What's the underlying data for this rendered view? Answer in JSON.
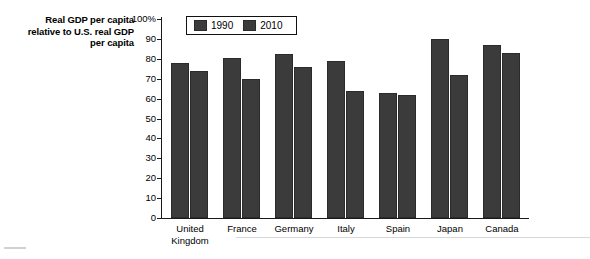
{
  "chart_data": {
    "type": "bar",
    "title": "Real GDP per capita relative to U.S. real GDP per capita",
    "title_lines": [
      "Real GDP per capita",
      "relative to U.S. real GDP",
      "per capita"
    ],
    "xlabel": "",
    "ylabel": "",
    "ylim": [
      0,
      100
    ],
    "yticks": [
      {
        "value": 100,
        "label": "100%"
      },
      {
        "value": 90,
        "label": "90"
      },
      {
        "value": 80,
        "label": "80"
      },
      {
        "value": 70,
        "label": "70"
      },
      {
        "value": 60,
        "label": "60"
      },
      {
        "value": 50,
        "label": "50"
      },
      {
        "value": 40,
        "label": "40"
      },
      {
        "value": 30,
        "label": "30"
      },
      {
        "value": 20,
        "label": "20"
      },
      {
        "value": 10,
        "label": "10"
      },
      {
        "value": 0,
        "label": "0"
      }
    ],
    "grid": false,
    "legend_position": "top-left-inside",
    "categories": [
      "United Kingdom",
      "France",
      "Germany",
      "Italy",
      "Spain",
      "Japan",
      "Canada"
    ],
    "category_lines": [
      [
        "United",
        "Kingdom"
      ],
      [
        "France"
      ],
      [
        "Germany"
      ],
      [
        "Italy"
      ],
      [
        "Spain"
      ],
      [
        "Japan"
      ],
      [
        "Canada"
      ]
    ],
    "series": [
      {
        "name": "1990",
        "color": "#3b3b3b",
        "values": [
          78,
          80.5,
          82.5,
          79,
          63,
          90,
          87
        ]
      },
      {
        "name": "2010",
        "color": "#3b3b3b",
        "values": [
          74,
          70,
          76,
          64,
          62,
          72,
          83
        ]
      }
    ]
  },
  "legend": {
    "items": [
      {
        "label": "1990",
        "color": "#3b3b3b"
      },
      {
        "label": "2010",
        "color": "#3b3b3b"
      }
    ]
  },
  "colors": {
    "bar": "#3b3b3b",
    "bar_border": "#2b2b2b",
    "axis": "#1a1a1a",
    "background": "#ffffff",
    "rule": "#d8d8d8"
  }
}
